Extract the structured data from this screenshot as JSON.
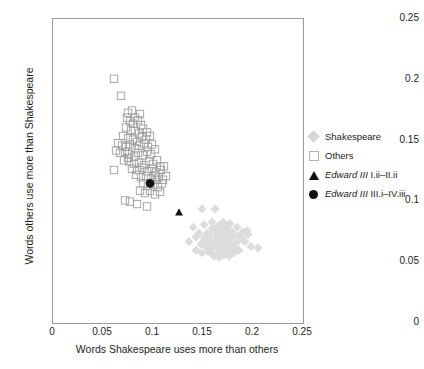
{
  "chart_data": {
    "type": "scatter",
    "title": "",
    "xlabel": "Words Shakespeare uses more than others",
    "ylabel": "Words others use more than Shakespeare",
    "xlim": [
      0,
      0.25
    ],
    "ylim": [
      0,
      0.25
    ],
    "xticks": [
      "0",
      "0.05",
      "0.1",
      "0.15",
      "0.2",
      "0.25"
    ],
    "yticks": [
      "0",
      "0.05",
      "0.1",
      "0.15",
      "0.2",
      "0.25"
    ],
    "xtick_values": [
      0,
      0.05,
      0.1,
      0.15,
      0.2,
      0.25
    ],
    "ytick_values": [
      0,
      0.05,
      0.1,
      0.15,
      0.2,
      0.25
    ],
    "grid": false,
    "legend_position": "right",
    "series": [
      {
        "name": "Shakespeare",
        "marker": "diamond",
        "color": "#dcdcdc",
        "filled": true,
        "points": [
          [
            0.15,
            0.093
          ],
          [
            0.163,
            0.093
          ],
          [
            0.141,
            0.078
          ],
          [
            0.152,
            0.08
          ],
          [
            0.16,
            0.082
          ],
          [
            0.171,
            0.079
          ],
          [
            0.178,
            0.081
          ],
          [
            0.185,
            0.078
          ],
          [
            0.191,
            0.074
          ],
          [
            0.196,
            0.072
          ],
          [
            0.137,
            0.066
          ],
          [
            0.144,
            0.07
          ],
          [
            0.155,
            0.073
          ],
          [
            0.162,
            0.075
          ],
          [
            0.166,
            0.072
          ],
          [
            0.17,
            0.076
          ],
          [
            0.173,
            0.07
          ],
          [
            0.176,
            0.073
          ],
          [
            0.168,
            0.068
          ],
          [
            0.172,
            0.066
          ],
          [
            0.177,
            0.067
          ],
          [
            0.181,
            0.07
          ],
          [
            0.158,
            0.068
          ],
          [
            0.163,
            0.066
          ],
          [
            0.149,
            0.064
          ],
          [
            0.154,
            0.062
          ],
          [
            0.159,
            0.06
          ],
          [
            0.164,
            0.062
          ],
          [
            0.169,
            0.063
          ],
          [
            0.174,
            0.061
          ],
          [
            0.179,
            0.063
          ],
          [
            0.184,
            0.065
          ],
          [
            0.188,
            0.068
          ],
          [
            0.193,
            0.066
          ],
          [
            0.199,
            0.062
          ],
          [
            0.206,
            0.061
          ],
          [
            0.144,
            0.059
          ],
          [
            0.15,
            0.057
          ],
          [
            0.156,
            0.058
          ],
          [
            0.161,
            0.056
          ],
          [
            0.167,
            0.057
          ],
          [
            0.172,
            0.055
          ],
          [
            0.177,
            0.054
          ],
          [
            0.182,
            0.057
          ],
          [
            0.187,
            0.059
          ],
          [
            0.165,
            0.071
          ],
          [
            0.17,
            0.074
          ],
          [
            0.175,
            0.077
          ],
          [
            0.18,
            0.074
          ],
          [
            0.16,
            0.077
          ],
          [
            0.166,
            0.079
          ],
          [
            0.171,
            0.082
          ],
          [
            0.157,
            0.071
          ],
          [
            0.152,
            0.069
          ],
          [
            0.147,
            0.073
          ],
          [
            0.186,
            0.071
          ],
          [
            0.19,
            0.069
          ],
          [
            0.195,
            0.075
          ],
          [
            0.168,
            0.059
          ],
          [
            0.173,
            0.058
          ],
          [
            0.178,
            0.06
          ],
          [
            0.183,
            0.062
          ],
          [
            0.162,
            0.054
          ],
          [
            0.167,
            0.053
          ],
          [
            0.153,
            0.066
          ],
          [
            0.158,
            0.064
          ]
        ]
      },
      {
        "name": "Others",
        "marker": "square",
        "color": "#9e9e9e",
        "filled": false,
        "points": [
          [
            0.062,
            0.2
          ],
          [
            0.069,
            0.186
          ],
          [
            0.076,
            0.172
          ],
          [
            0.08,
            0.174
          ],
          [
            0.083,
            0.168
          ],
          [
            0.078,
            0.165
          ],
          [
            0.086,
            0.166
          ],
          [
            0.089,
            0.162
          ],
          [
            0.074,
            0.16
          ],
          [
            0.079,
            0.158
          ],
          [
            0.083,
            0.157
          ],
          [
            0.087,
            0.155
          ],
          [
            0.091,
            0.159
          ],
          [
            0.095,
            0.156
          ],
          [
            0.071,
            0.153
          ],
          [
            0.076,
            0.151
          ],
          [
            0.081,
            0.15
          ],
          [
            0.085,
            0.148
          ],
          [
            0.09,
            0.152
          ],
          [
            0.094,
            0.15
          ],
          [
            0.098,
            0.153
          ],
          [
            0.066,
            0.147
          ],
          [
            0.07,
            0.145
          ],
          [
            0.074,
            0.144
          ],
          [
            0.078,
            0.146
          ],
          [
            0.083,
            0.143
          ],
          [
            0.087,
            0.145
          ],
          [
            0.092,
            0.147
          ],
          [
            0.096,
            0.144
          ],
          [
            0.1,
            0.146
          ],
          [
            0.064,
            0.141
          ],
          [
            0.068,
            0.139
          ],
          [
            0.073,
            0.14
          ],
          [
            0.077,
            0.138
          ],
          [
            0.082,
            0.136
          ],
          [
            0.086,
            0.139
          ],
          [
            0.091,
            0.137
          ],
          [
            0.095,
            0.14
          ],
          [
            0.099,
            0.138
          ],
          [
            0.103,
            0.142
          ],
          [
            0.062,
            0.125
          ],
          [
            0.077,
            0.132
          ],
          [
            0.082,
            0.13
          ],
          [
            0.087,
            0.131
          ],
          [
            0.092,
            0.129
          ],
          [
            0.097,
            0.132
          ],
          [
            0.101,
            0.13
          ],
          [
            0.105,
            0.133
          ],
          [
            0.108,
            0.128
          ],
          [
            0.08,
            0.126
          ],
          [
            0.085,
            0.125
          ],
          [
            0.09,
            0.127
          ],
          [
            0.095,
            0.124
          ],
          [
            0.1,
            0.126
          ],
          [
            0.104,
            0.123
          ],
          [
            0.109,
            0.125
          ],
          [
            0.112,
            0.128
          ],
          [
            0.084,
            0.121
          ],
          [
            0.089,
            0.119
          ],
          [
            0.094,
            0.12
          ],
          [
            0.099,
            0.118
          ],
          [
            0.103,
            0.121
          ],
          [
            0.107,
            0.119
          ],
          [
            0.111,
            0.117
          ],
          [
            0.114,
            0.12
          ],
          [
            0.091,
            0.114
          ],
          [
            0.096,
            0.112
          ],
          [
            0.101,
            0.113
          ],
          [
            0.106,
            0.111
          ],
          [
            0.11,
            0.114
          ],
          [
            0.088,
            0.108
          ],
          [
            0.093,
            0.106
          ],
          [
            0.098,
            0.108
          ],
          [
            0.103,
            0.105
          ],
          [
            0.108,
            0.107
          ],
          [
            0.073,
            0.1
          ],
          [
            0.078,
            0.099
          ],
          [
            0.085,
            0.097
          ],
          [
            0.095,
            0.095
          ],
          [
            0.105,
            0.117
          ],
          [
            0.076,
            0.135
          ],
          [
            0.072,
            0.133
          ],
          [
            0.081,
            0.163
          ],
          [
            0.075,
            0.168
          ],
          [
            0.088,
            0.171
          ]
        ]
      },
      {
        "name": "Edward III I.ii-II.ii",
        "marker": "triangle",
        "color": "#111111",
        "filled": true,
        "points": [
          [
            0.127,
            0.09
          ]
        ]
      },
      {
        "name": "Edward III III.i-IV.iii",
        "marker": "circle",
        "color": "#111111",
        "filled": true,
        "points": [
          [
            0.098,
            0.114
          ]
        ]
      }
    ]
  },
  "legend": {
    "items": [
      {
        "label": "Shakespeare",
        "label_italic": "",
        "label_rest": "",
        "marker": "diamond-marker"
      },
      {
        "label": "Others",
        "label_italic": "",
        "label_rest": "",
        "marker": "square-marker"
      },
      {
        "label": "Edward III I.ii–II.ii",
        "label_italic": "Edward III",
        "label_rest": " I.ii–II.ii",
        "marker": "triangle-marker"
      },
      {
        "label": "Edward III III.i–IV.iii",
        "label_italic": "Edward III",
        "label_rest": " III.i–IV.iii",
        "marker": "circle-marker"
      }
    ]
  },
  "colors": {
    "shakespeare_fill": "#dcdcdc",
    "others_stroke": "#9e9e9e",
    "highlight": "#111111",
    "axis": "#9a9a9a",
    "text": "#1d1d1d"
  }
}
